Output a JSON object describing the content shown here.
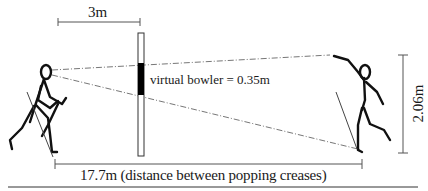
{
  "diagram": {
    "labels": {
      "screen_offset": "3m",
      "virtual_bowler": "virtual bowler = 0.35m",
      "crease_distance": "17.7m (distance between popping creases)",
      "bowler_height": "2.06m"
    },
    "elements": {
      "left_figure": "batsman stick figure with bat, facing right",
      "right_figure": "bowler stick figure in delivery stride, arm raised",
      "screen": "vertical projection screen with black segment representing scaled virtual bowler",
      "sight_lines": "dash-dot lines from batsman's eye to bowler's hand and foot, passing through screen"
    },
    "colors": {
      "figure": "#111111",
      "dimension_line": "#555555",
      "sight_line": "#777777",
      "screen_fill": "#ffffff",
      "virtual_bowler_fill": "#000000"
    }
  }
}
